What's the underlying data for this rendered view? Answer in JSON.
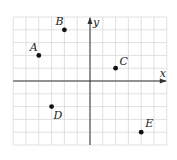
{
  "diagram": {
    "type": "coordinate-grid",
    "axes": {
      "x_label": "x",
      "y_label": "y"
    },
    "grid": {
      "x_min": -6,
      "x_max": 6,
      "y_min": -5,
      "y_max": 5,
      "step": 1
    },
    "colors": {
      "grid": "#d9d9d9",
      "axis": "#333333",
      "point": "#111111",
      "label": "#222222"
    },
    "points": [
      {
        "label": "A",
        "x": -4,
        "y": 2,
        "label_dx": -9,
        "label_dy": -4
      },
      {
        "label": "B",
        "x": -2,
        "y": 4,
        "label_dx": -9,
        "label_dy": -5
      },
      {
        "label": "C",
        "x": 2,
        "y": 1,
        "label_dx": 4,
        "label_dy": -3
      },
      {
        "label": "D",
        "x": -3,
        "y": -2,
        "label_dx": 2,
        "label_dy": 12
      },
      {
        "label": "E",
        "x": 4,
        "y": -4,
        "label_dx": 4,
        "label_dy": -5
      }
    ]
  }
}
